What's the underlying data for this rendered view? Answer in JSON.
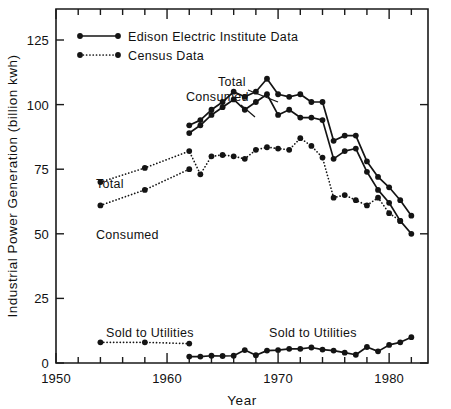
{
  "chart_data": {
    "type": "line",
    "title": "",
    "subtitle": "",
    "xlabel": "Year",
    "ylabel": "Industrial Power Generation (billion kwh)",
    "xlim": [
      1950,
      1983.5
    ],
    "ylim": [
      0,
      137
    ],
    "x_ticks_major": [
      1950,
      1960,
      1970,
      1980
    ],
    "x_tick_labels": [
      "1950",
      "1960",
      "1970",
      "1980"
    ],
    "x_ticks_minor_step": 2,
    "y_ticks": [
      0,
      25,
      50,
      75,
      100,
      125
    ],
    "y_tick_labels": [
      "0",
      "25",
      "50",
      "75",
      "100",
      "125"
    ],
    "grid": false,
    "legend_position": "top-left",
    "legend": [
      {
        "label": "Edison Electric Institute Data",
        "style": "solid",
        "marker": "filled-circle"
      },
      {
        "label": "Census Data",
        "style": "dotted",
        "marker": "filled-circle"
      }
    ],
    "annotations": [
      {
        "text": "Total",
        "series": "eei-total",
        "note": "leader line to upper solid curve near 1968"
      },
      {
        "text": "Consumed",
        "series": "eei-consumed",
        "note": "leader line to lower solid curve near 1966"
      },
      {
        "text": "Total",
        "series": "census-total",
        "note": "label left of upper dotted curve near 1955"
      },
      {
        "text": "Consumed",
        "series": "census-consumed",
        "note": "label below lower dotted curve near 1955"
      },
      {
        "text": "Sold to Utilities",
        "series": "census-sold",
        "note": "label above dotted low series near 1957"
      },
      {
        "text": "Sold to Utilities",
        "series": "eei-sold",
        "note": "label above solid low series near 1971"
      }
    ],
    "series": [
      {
        "name": "Total (Edison Electric Institute)",
        "key": "eei-total",
        "style": "solid",
        "x": [
          1962,
          1963,
          1964,
          1965,
          1966,
          1967,
          1968,
          1969,
          1970,
          1971,
          1972,
          1973,
          1974,
          1975,
          1976,
          1977,
          1978,
          1979,
          1980,
          1981,
          1982
        ],
        "values": [
          92,
          94,
          98,
          101,
          105,
          103,
          105,
          110,
          104,
          103,
          104,
          101,
          101,
          86,
          88,
          88,
          78,
          72,
          68,
          63,
          57
        ]
      },
      {
        "name": "Consumed (Edison Electric Institute)",
        "key": "eei-consumed",
        "style": "solid",
        "x": [
          1962,
          1963,
          1964,
          1965,
          1966,
          1967,
          1968,
          1969,
          1970,
          1971,
          1972,
          1973,
          1974,
          1975,
          1976,
          1977,
          1978,
          1979,
          1980,
          1981,
          1982
        ],
        "values": [
          89,
          92,
          96,
          99,
          102,
          98,
          101,
          104,
          96,
          98,
          95,
          95,
          94,
          79,
          82,
          83,
          74,
          67,
          62,
          55,
          50
        ]
      },
      {
        "name": "Total (Census)",
        "key": "census-total",
        "style": "dotted",
        "x": [
          1954,
          1958,
          1962,
          1963,
          1964,
          1965,
          1966,
          1967,
          1968,
          1969,
          1970,
          1971,
          1972,
          1973,
          1974,
          1975,
          1976,
          1977,
          1978,
          1979,
          1980,
          1981
        ],
        "values": [
          70,
          75.5,
          82,
          73,
          80,
          80.5,
          80,
          79,
          82.5,
          83.5,
          83,
          82.5,
          87,
          84,
          79.5,
          64,
          65,
          63,
          61,
          64,
          58,
          55
        ]
      },
      {
        "name": "Consumed (Census)",
        "key": "census-consumed",
        "style": "dotted",
        "x": [
          1954,
          1958,
          1962
        ],
        "values": [
          61,
          67,
          75
        ]
      },
      {
        "name": "Sold to Utilities (Census)",
        "key": "census-sold",
        "style": "dotted",
        "x": [
          1954,
          1958,
          1962
        ],
        "values": [
          8,
          8,
          7.5
        ]
      },
      {
        "name": "Sold to Utilities (Edison Electric Institute)",
        "key": "eei-sold",
        "style": "solid",
        "x": [
          1962,
          1963,
          1964,
          1965,
          1966,
          1967,
          1968,
          1969,
          1970,
          1971,
          1972,
          1973,
          1974,
          1975,
          1976,
          1977,
          1978,
          1979,
          1980,
          1981,
          1982
        ],
        "values": [
          2.5,
          2.5,
          2.8,
          2.7,
          2.8,
          5,
          3,
          4.8,
          5,
          5.5,
          5.5,
          6,
          5.2,
          4.8,
          4,
          3.2,
          6.2,
          4.5,
          7,
          8,
          10
        ]
      }
    ]
  },
  "colors": {
    "ink": "#141414",
    "background": "#ffffff"
  }
}
